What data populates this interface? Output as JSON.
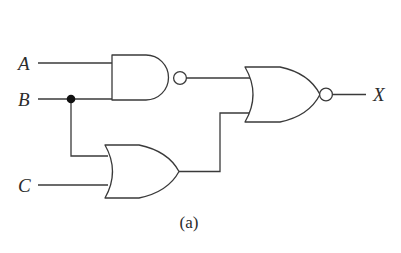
{
  "figure": {
    "caption": "(a)",
    "background_color": "#ffffff",
    "line_color": "#3a3a3a",
    "label_color": "#2b2b2b",
    "dot_color": "#111111"
  },
  "inputs": [
    {
      "name": "input-a",
      "label": "A"
    },
    {
      "name": "input-b",
      "label": "B"
    },
    {
      "name": "input-c",
      "label": "C"
    }
  ],
  "outputs": [
    {
      "name": "output-x",
      "label": "X"
    }
  ],
  "gates": [
    {
      "name": "nand-gate",
      "type": "NAND",
      "inputs": [
        "A",
        "B"
      ],
      "inverted": true
    },
    {
      "name": "or-gate",
      "type": "OR",
      "inputs": [
        "B",
        "C"
      ],
      "inverted": false
    },
    {
      "name": "nor-gate",
      "type": "NOR",
      "inputs": [
        "NAND-out",
        "OR-out"
      ],
      "inverted": true
    }
  ],
  "nodes": [
    {
      "name": "b-junction",
      "signal": "B"
    }
  ]
}
